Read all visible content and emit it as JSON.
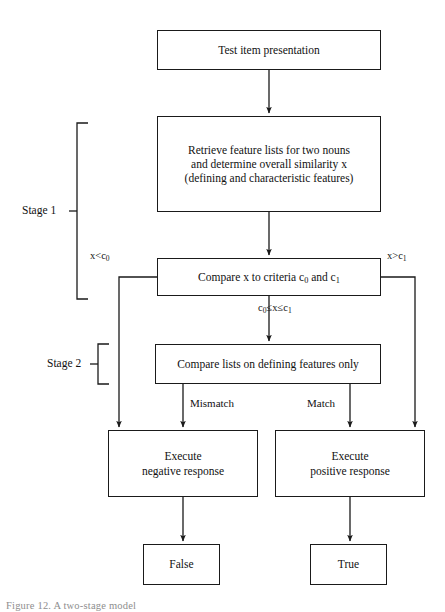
{
  "figure": {
    "type": "flowchart",
    "background_color": "#ffffff",
    "line_color": "#1a1a1a",
    "text_color": "#111111",
    "caption": "Figure 12. A two-stage model"
  },
  "nodes": [
    {
      "id": "test-item-presentation",
      "label": "Test item presentation",
      "shape": "rectangle",
      "x": 157,
      "y": 30,
      "w": 224,
      "h": 40,
      "font_size": 11.5
    },
    {
      "id": "retrieve-feature-lists",
      "label": "Retrieve feature lists for two nouns\nand determine overall similarity x\n(defining and characteristic features)",
      "shape": "rectangle",
      "x": 157,
      "y": 116,
      "w": 224,
      "h": 96,
      "font_size": 11.5
    },
    {
      "id": "compare-x-to-criteria",
      "label_html": "Compare x to criteria c<sub>0</sub> and c<sub>1</sub>",
      "label": "Compare x to criteria c0 and c1",
      "shape": "rectangle",
      "x": 157,
      "y": 258,
      "w": 224,
      "h": 38,
      "font_size": 11.5
    },
    {
      "id": "compare-defining-features",
      "label": "Compare lists on defining features only",
      "shape": "rectangle",
      "x": 155,
      "y": 344,
      "w": 226,
      "h": 40,
      "font_size": 11.5
    },
    {
      "id": "execute-negative-response",
      "label": "Execute\nnegative response",
      "shape": "rectangle",
      "x": 108,
      "y": 430,
      "w": 150,
      "h": 67,
      "font_size": 11.5
    },
    {
      "id": "execute-positive-response",
      "label": "Execute\npositive response",
      "shape": "rectangle",
      "x": 275,
      "y": 430,
      "w": 150,
      "h": 67,
      "font_size": 11.5
    },
    {
      "id": "false-outcome",
      "label": "False",
      "shape": "rectangle",
      "x": 143,
      "y": 544,
      "w": 77,
      "h": 41,
      "font_size": 11.5
    },
    {
      "id": "true-outcome",
      "label": "True",
      "shape": "rectangle",
      "x": 310,
      "y": 544,
      "w": 77,
      "h": 41,
      "font_size": 11.5
    }
  ],
  "edge_labels": [
    {
      "id": "x-less-than-c0",
      "label": "x<c0",
      "label_html": "x&lt;c<sub>0</sub>",
      "x": 90,
      "y": 251,
      "font_size": 10.5
    },
    {
      "id": "x-greater-than-c1",
      "label": "x>c1",
      "label_html": "x&gt;c<sub>1</sub>",
      "x": 387,
      "y": 251,
      "font_size": 10.5
    },
    {
      "id": "c0-le-x-le-c1",
      "label": "c0≤x≤c1",
      "label_html": "c<sub>0</sub>≤x≤c<sub>1</sub>",
      "x": 258,
      "y": 303,
      "font_size": 10.5
    },
    {
      "id": "mismatch",
      "label": "Mismatch",
      "x": 190,
      "y": 398,
      "font_size": 11
    },
    {
      "id": "match",
      "label": "Match",
      "x": 307,
      "y": 398,
      "font_size": 11
    }
  ],
  "stages": [
    {
      "id": "stage-1",
      "label": "Stage 1",
      "label_x": 22,
      "label_y": 196,
      "bracket_x": 77,
      "bracket_top": 123,
      "bracket_bottom": 299,
      "font_size": 11.5
    },
    {
      "id": "stage-2",
      "label": "Stage 2",
      "label_x": 47,
      "label_y": 358,
      "bracket_x": 98,
      "bracket_top": 344,
      "bracket_bottom": 384,
      "font_size": 11.5
    }
  ],
  "connectors": [
    {
      "id": "conn-presentation-to-retrieve",
      "from": "test-item-presentation",
      "to": "retrieve-feature-lists",
      "kind": "straight-down"
    },
    {
      "id": "conn-retrieve-to-compare-x",
      "from": "retrieve-feature-lists",
      "to": "compare-x-to-criteria",
      "kind": "straight-down"
    },
    {
      "id": "conn-compare-x-to-defining",
      "from": "compare-x-to-criteria",
      "to": "compare-defining-features",
      "kind": "straight-down",
      "label": "c0≤x≤c1"
    },
    {
      "id": "conn-compare-x-left-to-negative",
      "from": "compare-x-to-criteria",
      "to": "execute-negative-response",
      "kind": "elbow-left",
      "label": "x<c0"
    },
    {
      "id": "conn-compare-x-right-to-positive",
      "from": "compare-x-to-criteria",
      "to": "execute-positive-response",
      "kind": "elbow-right",
      "label": "x>c1"
    },
    {
      "id": "conn-defining-to-negative",
      "from": "compare-defining-features",
      "to": "execute-negative-response",
      "kind": "elbow-down-left",
      "label": "Mismatch"
    },
    {
      "id": "conn-defining-to-positive",
      "from": "compare-defining-features",
      "to": "execute-positive-response",
      "kind": "elbow-down-right",
      "label": "Match"
    },
    {
      "id": "conn-negative-to-false",
      "from": "execute-negative-response",
      "to": "false-outcome",
      "kind": "straight-down"
    },
    {
      "id": "conn-positive-to-true",
      "from": "execute-positive-response",
      "to": "true-outcome",
      "kind": "straight-down"
    }
  ]
}
